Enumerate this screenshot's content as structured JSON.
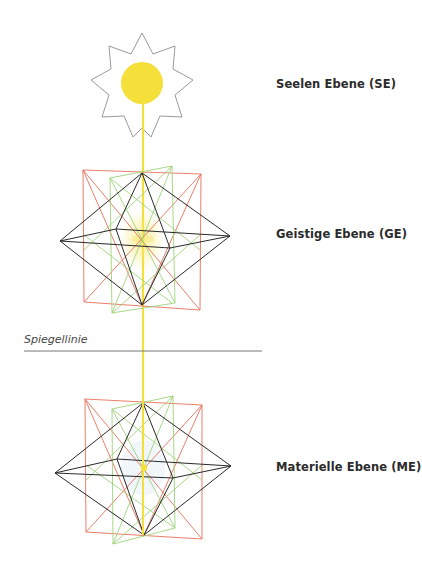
{
  "labels": {
    "soul": "Seelen Ebene (SE)",
    "spirit": "Geistige Ebene (GE)",
    "mirror": "Spiegellinie",
    "material": "Materielle Ebene (ME)"
  },
  "colors": {
    "axis": "#f3e03a",
    "sun": "#f5df3a",
    "star_outline": "#9a9a9a",
    "red_square": "#e8705a",
    "green_square": "#9ed47a",
    "octahedron": "#2a2a2a",
    "mirror_line": "#777777"
  },
  "figures": [
    {
      "name": "sun-star",
      "center": [
        142,
        82
      ],
      "points": 9
    },
    {
      "name": "upper-polyhedron",
      "apex_top": [
        142,
        173
      ],
      "apex_bottom": [
        142,
        305
      ],
      "left": [
        60,
        241
      ],
      "right": [
        230,
        236
      ]
    },
    {
      "name": "lower-polyhedron",
      "apex_top": [
        143,
        403
      ],
      "apex_bottom": [
        144,
        535
      ],
      "left": [
        55,
        473
      ],
      "right": [
        231,
        466
      ]
    }
  ]
}
